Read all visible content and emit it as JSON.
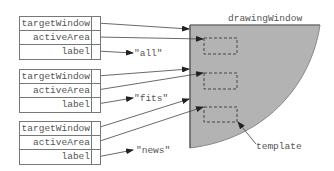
{
  "diagram": {
    "window": {
      "title": "drawingWindow",
      "fill": "#b3b3b3"
    },
    "records": [
      {
        "fields": [
          "targetWindow",
          "activeArea",
          "label"
        ],
        "label_value": "\"all\""
      },
      {
        "fields": [
          "targetWindow",
          "activeArea",
          "label"
        ],
        "label_value": "\"fits\""
      },
      {
        "fields": [
          "targetWindow",
          "activeArea",
          "label"
        ],
        "label_value": "\"news\""
      }
    ],
    "template_label": "template",
    "colors": {
      "line": "#444444",
      "text": "#555555",
      "box_border": "#777777"
    }
  }
}
